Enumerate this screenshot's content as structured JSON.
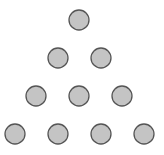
{
  "diagram": {
    "rows": [
      1,
      2,
      3,
      4
    ],
    "total_circles": 10,
    "circle_radius": 10,
    "fill_color": "#c4c4c4",
    "stroke_color": "#555555",
    "circles": [
      {
        "row": 1,
        "cx": 79,
        "cy": 20
      },
      {
        "row": 2,
        "cx": 58,
        "cy": 58
      },
      {
        "row": 2,
        "cx": 101,
        "cy": 58
      },
      {
        "row": 3,
        "cx": 36,
        "cy": 96
      },
      {
        "row": 3,
        "cx": 79,
        "cy": 96
      },
      {
        "row": 3,
        "cx": 122,
        "cy": 96
      },
      {
        "row": 4,
        "cx": 15,
        "cy": 134
      },
      {
        "row": 4,
        "cx": 58,
        "cy": 134
      },
      {
        "row": 4,
        "cx": 101,
        "cy": 134
      },
      {
        "row": 4,
        "cx": 144,
        "cy": 134
      }
    ]
  }
}
